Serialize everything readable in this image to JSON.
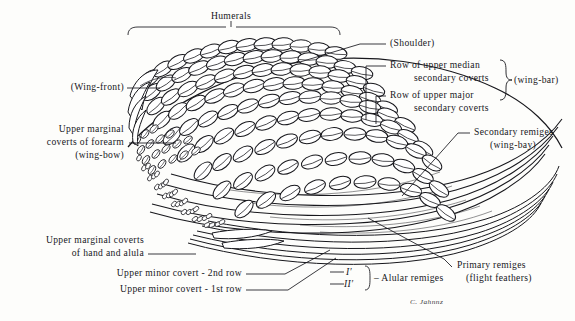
{
  "figure": {
    "type": "anatomical-diagram",
    "signature": "C. Jahnnz",
    "ink_color": "#17171c",
    "paper_color": "#fdfdfb"
  },
  "labels": {
    "humerals": "Humerals",
    "wing_front": "(Wing-front)",
    "shoulder": "(Shoulder)",
    "upper_marginal_forearm_l1": "Upper marginal",
    "upper_marginal_forearm_l2": "coverts of forearm",
    "upper_marginal_forearm_l3": "(wing-bow)",
    "upper_marginal_hand_l1": "Upper marginal coverts",
    "upper_marginal_hand_l2": "of hand and alula",
    "minor_covert_2nd": "Upper minor covert - 2nd row",
    "minor_covert_1st": "Upper minor covert - 1st row",
    "median_coverts_l1": "Row of upper median",
    "median_coverts_l2": "secondary coverts",
    "major_coverts_l1": "Row of upper major",
    "major_coverts_l2": "secondary coverts",
    "wing_bar": "(wing-bar)",
    "secondary_remiges_l1": "Secondary remiges",
    "secondary_remiges_l2": "(wing-bay)",
    "primary_remiges_l1": "Primary remiges",
    "primary_remiges_l2": "(flight feathers)",
    "alular_remiges": "– Alular remiges",
    "alular_1": "I′",
    "alular_2": "II′"
  }
}
